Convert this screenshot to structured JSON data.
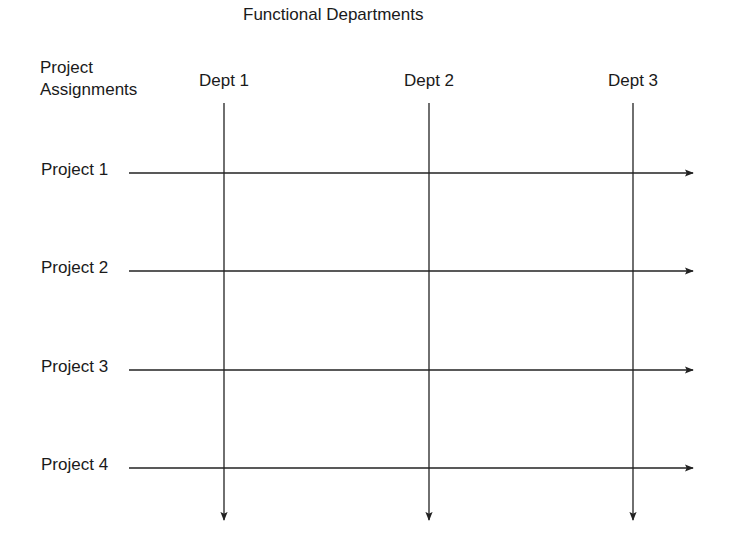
{
  "diagram": {
    "title": "Functional Departments",
    "row_header": [
      "Project",
      "Assignments"
    ],
    "departments": [
      {
        "label": "Dept 1"
      },
      {
        "label": "Dept 2"
      },
      {
        "label": "Dept 3"
      }
    ],
    "projects": [
      {
        "label": "Project 1"
      },
      {
        "label": "Project 2"
      },
      {
        "label": "Project 3"
      },
      {
        "label": "Project 4"
      }
    ],
    "line_color": "#222222"
  }
}
